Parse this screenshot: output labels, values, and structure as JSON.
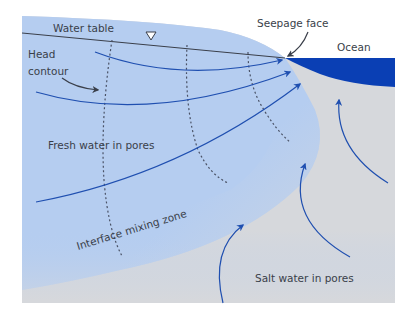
{
  "diagram": {
    "labels": {
      "water_table": "Water table",
      "head_contour_line1": "Head",
      "head_contour_line2": "contour",
      "seepage_face": "Seepage face",
      "ocean": "Ocean",
      "fresh_water": "Fresh water in pores",
      "interface_zone": "Interface mixing zone",
      "salt_water": "Salt water in pores"
    },
    "colors": {
      "fresh_water": "#b5cdf0",
      "salt_water": "#d6d8dc",
      "ocean": "#0a3fb4",
      "flow_lines": "#1f4fb0",
      "contours": "#4a5266",
      "text": "#3a3f4a"
    },
    "symbols": {
      "water_table_marker": "inverted-triangle"
    }
  }
}
